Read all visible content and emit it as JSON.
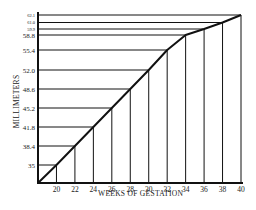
{
  "chart_data": {
    "type": "line",
    "title": "",
    "xlabel": "WEEKS OF GESTATION",
    "ylabel": "MILLIMETERS",
    "x_ticks": [
      "20",
      "22",
      "24",
      "26",
      "28",
      "30",
      "32",
      "34",
      "36",
      "38",
      "40"
    ],
    "y_ticks": [
      "35",
      "38.4",
      "41.8",
      "45.2",
      "48.6",
      "52.0",
      "55.4",
      "58.8",
      "59.9",
      "61.0",
      "62.1"
    ],
    "x": [
      20,
      22,
      24,
      26,
      28,
      30,
      32,
      34,
      36,
      38,
      40
    ],
    "series": [
      {
        "name": "Millimeters by week",
        "values": [
          35,
          38.4,
          41.8,
          45.2,
          48.6,
          52.0,
          55.4,
          58.8,
          59.9,
          61.0,
          62.1
        ]
      }
    ],
    "xlim": [
      18,
      40
    ],
    "grid": "drop lines from each data point to both axes",
    "legend": "none"
  },
  "axis": {
    "x_title": "WEEKS OF GESTATION",
    "y_title": "MILLIMETERS"
  },
  "colors": {
    "line": "#111111",
    "background": "#ffffff"
  }
}
